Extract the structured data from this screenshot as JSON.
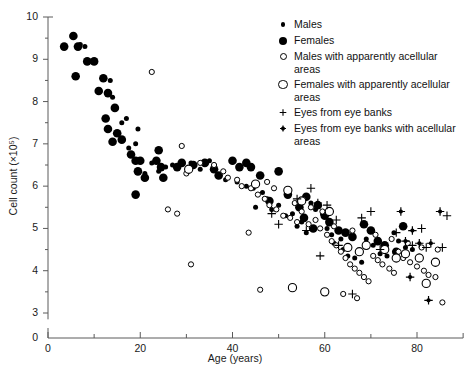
{
  "chart_data": {
    "type": "scatter",
    "title": "",
    "xlabel": "Age (years)",
    "ylabel": "Cell count (×10⁵)",
    "xlim": [
      0,
      90
    ],
    "ylim": [
      2.6,
      10
    ],
    "xticks": [
      0,
      20,
      40,
      60,
      80
    ],
    "xminorticks": [
      10,
      30,
      50,
      70
    ],
    "yticks": [
      3,
      4,
      5,
      6,
      7,
      8,
      9,
      10
    ],
    "yminorticks": [
      3.5,
      4.5,
      5.5,
      6.5,
      7.5,
      8.5,
      9.5
    ],
    "grid": false,
    "axis_break_y": true,
    "legend_position": "top-right",
    "series": [
      {
        "name": "Males",
        "marker": "male",
        "points": [
          [
            7.0,
            9.35
          ],
          [
            8.0,
            9.3
          ],
          [
            13.5,
            8.5
          ],
          [
            17.0,
            7.6
          ],
          [
            19.5,
            7.35
          ],
          [
            19.0,
            7.0
          ],
          [
            17.5,
            6.9
          ],
          [
            21.0,
            6.3
          ],
          [
            24.0,
            6.35
          ],
          [
            35.0,
            6.6
          ],
          [
            38.5,
            6.15
          ],
          [
            41.0,
            6.1
          ],
          [
            43.0,
            6.0
          ],
          [
            44.5,
            5.95
          ],
          [
            46.5,
            5.85
          ],
          [
            47.5,
            5.7
          ],
          [
            50.0,
            5.55
          ],
          [
            51.5,
            5.3
          ],
          [
            53.0,
            5.35
          ],
          [
            55.0,
            5.15
          ],
          [
            56.0,
            4.9
          ],
          [
            58.0,
            5.45
          ],
          [
            59.5,
            5.35
          ],
          [
            60.5,
            5.0
          ],
          [
            61.5,
            4.85
          ],
          [
            62.0,
            4.65
          ],
          [
            63.5,
            4.75
          ],
          [
            64.0,
            4.5
          ],
          [
            65.0,
            4.35
          ],
          [
            66.5,
            4.3
          ],
          [
            68.0,
            4.2
          ],
          [
            69.0,
            4.75
          ],
          [
            70.5,
            4.6
          ],
          [
            72.0,
            4.4
          ],
          [
            73.5,
            4.35
          ],
          [
            75.0,
            4.9
          ],
          [
            76.0,
            4.7
          ],
          [
            77.5,
            4.55
          ],
          [
            79.0,
            4.5
          ],
          [
            80.5,
            4.35
          ],
          [
            57.0,
            5.6
          ],
          [
            54.0,
            5.05
          ],
          [
            48.5,
            5.45
          ],
          [
            45.0,
            5.5
          ],
          [
            31.0,
            6.55
          ],
          [
            33.0,
            6.4
          ],
          [
            27.0,
            6.5
          ],
          [
            25.5,
            6.45
          ],
          [
            22.5,
            6.55
          ],
          [
            16.0,
            7.5
          ],
          [
            14.0,
            8.1
          ]
        ]
      },
      {
        "name": "Females",
        "marker": "female",
        "points": [
          [
            5.5,
            9.55
          ],
          [
            3.5,
            9.3
          ],
          [
            6.5,
            9.3
          ],
          [
            8.5,
            8.95
          ],
          [
            10.0,
            8.95
          ],
          [
            6.0,
            8.6
          ],
          [
            12.0,
            8.55
          ],
          [
            11.0,
            8.25
          ],
          [
            13.0,
            8.2
          ],
          [
            14.5,
            7.85
          ],
          [
            12.5,
            7.6
          ],
          [
            13.0,
            7.35
          ],
          [
            15.0,
            7.25
          ],
          [
            14.0,
            7.05
          ],
          [
            16.0,
            7.1
          ],
          [
            18.0,
            6.75
          ],
          [
            19.0,
            6.6
          ],
          [
            20.0,
            6.6
          ],
          [
            19.5,
            6.35
          ],
          [
            21.0,
            6.2
          ],
          [
            19.0,
            5.8
          ],
          [
            24.0,
            6.85
          ],
          [
            23.5,
            6.6
          ],
          [
            24.5,
            6.45
          ],
          [
            25.0,
            6.2
          ],
          [
            29.0,
            6.55
          ],
          [
            31.5,
            6.5
          ],
          [
            34.0,
            6.55
          ],
          [
            36.0,
            6.4
          ],
          [
            37.0,
            6.25
          ],
          [
            40.0,
            6.6
          ],
          [
            43.0,
            6.55
          ],
          [
            46.0,
            6.25
          ],
          [
            48.0,
            5.65
          ],
          [
            50.0,
            6.35
          ],
          [
            52.0,
            5.8
          ],
          [
            54.5,
            5.5
          ],
          [
            56.0,
            5.75
          ],
          [
            58.5,
            5.55
          ],
          [
            60.0,
            5.3
          ],
          [
            61.0,
            5.15
          ],
          [
            63.0,
            4.95
          ],
          [
            64.5,
            4.9
          ],
          [
            66.0,
            4.8
          ],
          [
            68.5,
            5.1
          ],
          [
            70.0,
            4.95
          ],
          [
            71.5,
            4.7
          ],
          [
            73.0,
            4.6
          ],
          [
            75.5,
            4.45
          ],
          [
            77.0,
            5.05
          ],
          [
            28.0,
            6.45
          ],
          [
            41.5,
            6.45
          ],
          [
            44.0,
            6.45
          ],
          [
            55.5,
            5.25
          ],
          [
            57.5,
            5.0
          ]
        ]
      },
      {
        "name": "Males with apparently acellular areas",
        "marker": "male-open",
        "points": [
          [
            22.5,
            8.7
          ],
          [
            29.0,
            6.95
          ],
          [
            30.0,
            6.3
          ],
          [
            33.0,
            6.55
          ],
          [
            36.0,
            6.5
          ],
          [
            38.0,
            6.35
          ],
          [
            39.0,
            6.2
          ],
          [
            41.0,
            6.15
          ],
          [
            42.0,
            6.0
          ],
          [
            44.0,
            5.95
          ],
          [
            45.5,
            5.8
          ],
          [
            47.0,
            5.7
          ],
          [
            48.0,
            5.55
          ],
          [
            49.5,
            5.45
          ],
          [
            51.0,
            5.3
          ],
          [
            52.5,
            5.25
          ],
          [
            26.0,
            5.45
          ],
          [
            28.0,
            5.35
          ],
          [
            31.0,
            4.15
          ],
          [
            54.0,
            5.15
          ],
          [
            56.5,
            5.1
          ],
          [
            58.0,
            5.2
          ],
          [
            59.0,
            5.0
          ],
          [
            60.5,
            4.85
          ],
          [
            61.5,
            4.7
          ],
          [
            62.5,
            4.6
          ],
          [
            63.5,
            4.45
          ],
          [
            64.5,
            4.3
          ],
          [
            65.5,
            4.15
          ],
          [
            66.5,
            4.05
          ],
          [
            67.5,
            3.95
          ],
          [
            68.5,
            3.85
          ],
          [
            69.5,
            3.75
          ],
          [
            70.5,
            4.35
          ],
          [
            71.5,
            4.25
          ],
          [
            72.5,
            4.15
          ],
          [
            74.0,
            4.05
          ],
          [
            75.0,
            3.95
          ],
          [
            76.0,
            4.45
          ],
          [
            77.0,
            4.3
          ],
          [
            78.5,
            4.2
          ],
          [
            80.0,
            4.1
          ],
          [
            81.5,
            4.0
          ],
          [
            82.5,
            3.9
          ],
          [
            84.0,
            3.85
          ],
          [
            85.5,
            3.25
          ],
          [
            47.5,
            6.1
          ],
          [
            49.0,
            5.95
          ],
          [
            53.5,
            5.6
          ],
          [
            55.0,
            5.4
          ],
          [
            57.0,
            5.5
          ],
          [
            59.5,
            5.4
          ],
          [
            62.0,
            5.05
          ],
          [
            66.0,
            4.95
          ],
          [
            71.0,
            4.85
          ],
          [
            74.5,
            4.75
          ],
          [
            78.0,
            4.65
          ],
          [
            81.0,
            4.55
          ],
          [
            84.5,
            4.5
          ],
          [
            43.5,
            4.9
          ],
          [
            46.0,
            3.55
          ],
          [
            64.0,
            3.45
          ],
          [
            67.0,
            3.35
          ]
        ]
      },
      {
        "name": "Females with apparently acellular areas",
        "marker": "female-open",
        "points": [
          [
            30.5,
            6.4
          ],
          [
            45.0,
            6.05
          ],
          [
            52.0,
            5.9
          ],
          [
            55.0,
            5.65
          ],
          [
            61.0,
            5.4
          ],
          [
            65.0,
            4.55
          ],
          [
            69.0,
            4.6
          ],
          [
            73.0,
            4.5
          ],
          [
            77.5,
            4.4
          ],
          [
            80.5,
            4.3
          ],
          [
            84.0,
            4.2
          ],
          [
            60.0,
            3.5
          ],
          [
            53.0,
            3.6
          ],
          [
            67.5,
            4.45
          ],
          [
            75.5,
            4.3
          ],
          [
            82.0,
            3.7
          ]
        ]
      },
      {
        "name": "Eyes from eye banks",
        "marker": "plus",
        "points": [
          [
            48.5,
            5.35
          ],
          [
            54.0,
            5.7
          ],
          [
            57.0,
            5.95
          ],
          [
            58.5,
            5.6
          ],
          [
            60.5,
            5.55
          ],
          [
            62.5,
            5.2
          ],
          [
            56.0,
            4.95
          ],
          [
            63.0,
            4.6
          ],
          [
            68.0,
            5.25
          ],
          [
            70.0,
            5.4
          ],
          [
            72.0,
            4.5
          ],
          [
            75.5,
            4.9
          ],
          [
            79.0,
            4.6
          ],
          [
            82.0,
            4.55
          ],
          [
            85.5,
            4.55
          ],
          [
            86.5,
            5.3
          ],
          [
            66.0,
            3.45
          ],
          [
            50.0,
            5.1
          ],
          [
            59.0,
            4.35
          ],
          [
            81.0,
            5.0
          ]
        ]
      },
      {
        "name": "Eyes from eye banks with acellular areas",
        "marker": "plus-filled",
        "points": [
          [
            76.5,
            5.4
          ],
          [
            85.0,
            5.4
          ],
          [
            79.0,
            4.95
          ],
          [
            77.5,
            4.7
          ],
          [
            80.5,
            4.65
          ],
          [
            83.0,
            4.65
          ],
          [
            78.5,
            3.85
          ],
          [
            82.5,
            3.3
          ]
        ]
      }
    ]
  },
  "legend": {
    "items": [
      {
        "label": "Males",
        "marker": "male"
      },
      {
        "label": "Females",
        "marker": "female"
      },
      {
        "label": "Males with apparently acellular areas",
        "marker": "male-open"
      },
      {
        "label": "Females with apparently acellular areas",
        "marker": "female-open"
      },
      {
        "label": "Eyes from eye banks",
        "marker": "plus"
      },
      {
        "label": "Eyes from eye banks with acellular areas",
        "marker": "plus-filled"
      }
    ]
  },
  "axes": {
    "xlabel": "Age (years)",
    "ylabel": "Cell count (×10⁵)",
    "x_tick_labels": [
      "0",
      "20",
      "40",
      "60",
      "80"
    ],
    "y_tick_labels": [
      "3",
      "4",
      "5",
      "6",
      "7",
      "8",
      "9",
      "10"
    ],
    "y_origin_label": "0"
  },
  "colors": {
    "marker": "#000000",
    "axis": "#5a5a5a",
    "text": "#111111",
    "background": "#ffffff"
  }
}
